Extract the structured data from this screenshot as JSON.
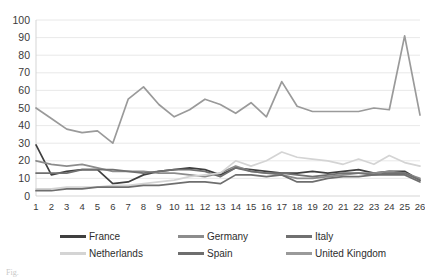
{
  "chart_data": {
    "type": "line",
    "title": "",
    "subtitle": "",
    "xlabel": "",
    "ylabel": "",
    "xlim": [
      1,
      26
    ],
    "ylim": [
      0,
      100
    ],
    "ytick_step": 10,
    "grid": true,
    "grid_axis": "y",
    "legend_position": "bottom",
    "legend_columns": 3,
    "x": [
      1,
      2,
      3,
      4,
      5,
      6,
      7,
      8,
      9,
      10,
      11,
      12,
      13,
      14,
      15,
      16,
      17,
      18,
      19,
      20,
      21,
      22,
      23,
      24,
      25,
      26
    ],
    "categories": [
      "1",
      "2",
      "3",
      "4",
      "5",
      "6",
      "7",
      "8",
      "9",
      "10",
      "11",
      "12",
      "13",
      "14",
      "15",
      "16",
      "17",
      "18",
      "19",
      "20",
      "21",
      "22",
      "23",
      "24",
      "25",
      "26"
    ],
    "ytick_labels": [
      "0",
      "10",
      "20",
      "30",
      "40",
      "50",
      "60",
      "70",
      "80",
      "90",
      "100"
    ],
    "ytick_values": [
      0,
      10,
      20,
      30,
      40,
      50,
      60,
      70,
      80,
      90,
      100
    ],
    "series": [
      {
        "name": "France",
        "color": "#3f3f3f",
        "values": [
          29,
          12,
          14,
          15,
          15,
          7,
          8,
          12,
          14,
          15,
          16,
          15,
          12,
          16,
          15,
          14,
          13,
          13,
          14,
          13,
          14,
          15,
          13,
          14,
          14,
          9
        ]
      },
      {
        "name": "Germany",
        "color": "#8c8c8c",
        "values": [
          20,
          18,
          17,
          18,
          16,
          14,
          14,
          14,
          13,
          13,
          12,
          11,
          13,
          17,
          14,
          13,
          12,
          10,
          10,
          11,
          12,
          13,
          13,
          14,
          13,
          10
        ]
      },
      {
        "name": "Italy",
        "color": "#707070",
        "values": [
          13,
          13,
          13,
          15,
          15,
          15,
          14,
          13,
          14,
          15,
          15,
          14,
          11,
          16,
          14,
          13,
          13,
          12,
          11,
          12,
          13,
          13,
          12,
          13,
          13,
          9
        ]
      },
      {
        "name": "Netherlands",
        "color": "#d4d4d4",
        "values": [
          4,
          4,
          5,
          5,
          5,
          6,
          6,
          7,
          8,
          9,
          11,
          12,
          13,
          20,
          17,
          20,
          25,
          22,
          21,
          20,
          18,
          21,
          18,
          23,
          19,
          17
        ]
      },
      {
        "name": "Spain",
        "color": "#6e6e6e",
        "values": [
          3,
          3,
          4,
          4,
          5,
          5,
          5,
          6,
          6,
          7,
          8,
          8,
          7,
          12,
          12,
          11,
          12,
          8,
          8,
          10,
          11,
          11,
          12,
          12,
          12,
          8
        ]
      },
      {
        "name": "United Kingdom",
        "color": "#9a9a9a",
        "values": [
          50,
          44,
          38,
          36,
          37,
          30,
          55,
          62,
          52,
          45,
          49,
          55,
          52,
          47,
          53,
          45,
          65,
          51,
          48,
          48,
          48,
          48,
          50,
          49,
          91,
          46
        ]
      }
    ]
  },
  "legend": {
    "rows": [
      [
        {
          "label": "France",
          "color": "#3f3f3f"
        },
        {
          "label": "Germany",
          "color": "#8c8c8c"
        },
        {
          "label": "Italy",
          "color": "#707070"
        }
      ],
      [
        {
          "label": "Netherlands",
          "color": "#d4d4d4"
        },
        {
          "label": "Spain",
          "color": "#6e6e6e"
        },
        {
          "label": "United Kingdom",
          "color": "#9a9a9a"
        }
      ]
    ]
  },
  "caption": {
    "text": "Fig."
  }
}
